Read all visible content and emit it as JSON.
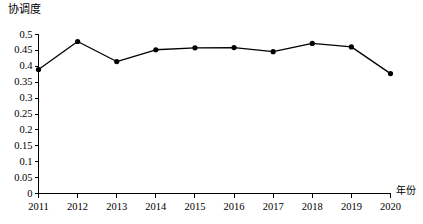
{
  "chart_data": {
    "type": "line",
    "title": "",
    "ylabel": "协调度",
    "xlabel": "年份",
    "categories": [
      "2011",
      "2012",
      "2013",
      "2014",
      "2015",
      "2016",
      "2017",
      "2018",
      "2019",
      "2020"
    ],
    "values": [
      0.39,
      0.478,
      0.415,
      0.452,
      0.458,
      0.459,
      0.446,
      0.472,
      0.461,
      0.377
    ],
    "series": [
      {
        "name": "协调度",
        "values": [
          0.39,
          0.478,
          0.415,
          0.452,
          0.458,
          0.459,
          0.446,
          0.472,
          0.461,
          0.377
        ]
      }
    ],
    "ylim": [
      0,
      0.5
    ],
    "ytick_labels": [
      "0",
      "0.05",
      "0.1",
      "0.15",
      "0.2",
      "0.25",
      "0.3",
      "0.35",
      "0.4",
      "0.45",
      "0.5"
    ],
    "ytick_values": [
      0,
      0.05,
      0.1,
      0.15,
      0.2,
      0.25,
      0.3,
      0.35,
      0.4,
      0.45,
      0.5
    ],
    "xtick_labels": [
      "2011",
      "2012",
      "2013",
      "2014",
      "2015",
      "2016",
      "2017",
      "2018",
      "2019",
      "2020"
    ],
    "grid": false,
    "legend": "none",
    "line_color": "#000000",
    "marker": "circle",
    "marker_color": "#000000",
    "axis_color": "#000000"
  },
  "axes": {
    "y_title": "协调度",
    "x_title": "年份"
  }
}
